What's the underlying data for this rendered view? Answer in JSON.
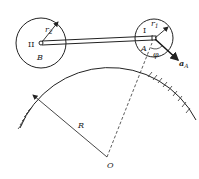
{
  "diagram": {
    "title": "",
    "labels": {
      "gear_II": "II",
      "gear_I": "I",
      "r2": "r",
      "r2_sub": "2",
      "r1": "r",
      "r1_sub": "1",
      "point_B": "B",
      "point_A": "A",
      "phi": "φ",
      "accel": "a",
      "accel_sub": "A",
      "radius_R": "R",
      "center_O": "O"
    },
    "elements": {
      "large_arc": {
        "center": [
          107,
          157
        ],
        "radius": 97,
        "hatched": true
      },
      "gear_II": {
        "center": [
          41,
          43
        ],
        "radius": 25
      },
      "gear_I": {
        "center": [
          154,
          38
        ],
        "radius": 19
      },
      "connecting_rod": {
        "from": "B",
        "to": "A"
      },
      "dashed_line": {
        "from": "O",
        "to": "A"
      },
      "accel_vector": {
        "from": "A",
        "direction": "down-right"
      }
    },
    "colors": {
      "stroke": "#222222",
      "background": "#ffffff"
    }
  }
}
